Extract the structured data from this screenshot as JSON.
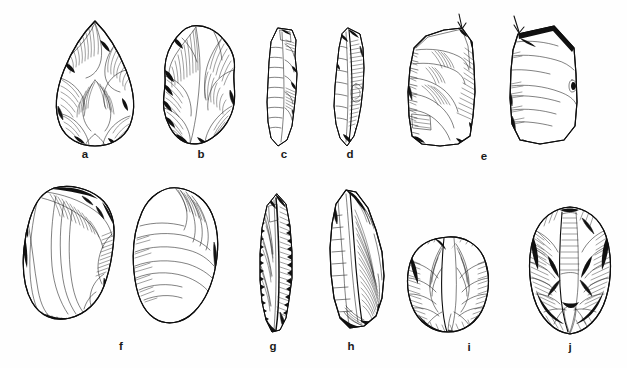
{
  "plate": {
    "kind": "archaeological-lithic-illustration",
    "technique": "pen-and-ink line drawing with hatched shading",
    "background_color": "#ffffff",
    "ink_color": "#111111",
    "rows": 2,
    "figure_count": 12,
    "label_count": 10,
    "label_style": "bold lowercase serif-less letters centered beneath each artifact"
  },
  "labels": {
    "a": "a",
    "b": "b",
    "c": "c",
    "d": "d",
    "e": "e",
    "f": "f",
    "g": "g",
    "h": "h",
    "i": "i",
    "j": "j"
  },
  "artifacts": [
    {
      "id": "a",
      "label": "a",
      "row": "top",
      "views": 1,
      "description": "teardrop / ovate bifacial handaxe with dense invasive flake scars",
      "orientation": "vertical, pointed tip up"
    },
    {
      "id": "b",
      "label": "b",
      "row": "top",
      "views": 1,
      "description": "irregular bifacially worked nodule / rough-out with stepped scars",
      "orientation": "vertical"
    },
    {
      "id": "c",
      "label": "c",
      "row": "top",
      "views": 1,
      "description": "narrow elongated blade with a central arris and fine marginal retouch",
      "orientation": "vertical"
    },
    {
      "id": "d",
      "label": "d",
      "row": "top",
      "views": 1,
      "description": "elongated flake / blade with steep lateral retouch and a notch",
      "orientation": "vertical"
    },
    {
      "id": "e",
      "label": "e",
      "row": "top",
      "views": 2,
      "description": "Levallois core fragment shown in two views, dorsal and lateral",
      "orientation": "vertical",
      "annotation": "two small downward arrows mark the striking platform on each view"
    },
    {
      "id": "f",
      "label": "f",
      "row": "bottom",
      "views": 2,
      "description": "broad oval Levallois flake shown dorsal (left) and ventral (right); ventral face shows concentric ripple marks",
      "orientation": "vertical"
    },
    {
      "id": "g",
      "label": "g",
      "row": "bottom",
      "views": 1,
      "description": "long slender retouched point with heavy bifacial edge retouch, darkly shaded",
      "orientation": "vertical"
    },
    {
      "id": "h",
      "label": "h",
      "row": "bottom",
      "views": 1,
      "description": "elongated flake with pronounced dorsal ridge and fine parallel hatching",
      "orientation": "vertical"
    },
    {
      "id": "i",
      "label": "i",
      "row": "bottom",
      "views": 1,
      "description": "rounded discoidal core with radial flake removals around the circumference",
      "orientation": "round"
    },
    {
      "id": "j",
      "label": "j",
      "row": "bottom",
      "views": 1,
      "description": "oval discoidal / Levallois core with centripetal flake scars",
      "orientation": "vertical oval"
    }
  ],
  "annotations": {
    "arrows": [
      {
        "for": "e",
        "view": "left",
        "points": "down",
        "meaning": "striking platform"
      },
      {
        "for": "e",
        "view": "right",
        "points": "down",
        "meaning": "striking platform"
      }
    ]
  }
}
